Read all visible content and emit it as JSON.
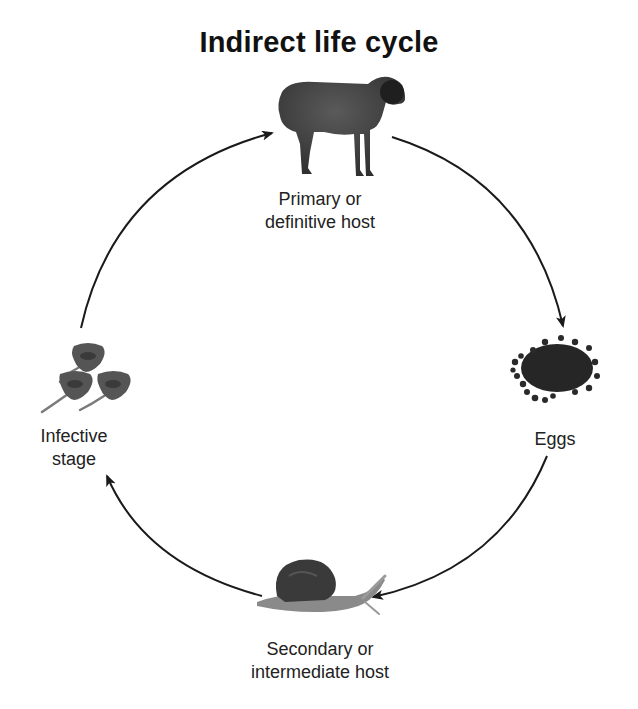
{
  "diagram": {
    "title": "Indirect life cycle",
    "type": "cycle",
    "direction": "clockwise",
    "colors": {
      "background": "#ffffff",
      "text": "#222222",
      "arrow": "#1a1a1a",
      "image_fill": "#3a3a3a"
    },
    "nodes": [
      {
        "id": "primary-host",
        "icon": "sheep-icon",
        "label_lines": [
          "Primary or",
          "definitive host"
        ],
        "position": "top"
      },
      {
        "id": "eggs",
        "icon": "eggs-cluster-icon",
        "label_lines": [
          "Eggs"
        ],
        "position": "right"
      },
      {
        "id": "secondary-host",
        "icon": "snail-icon",
        "label_lines": [
          "Secondary or",
          "intermediate host"
        ],
        "position": "bottom"
      },
      {
        "id": "infective-stage",
        "icon": "cercariae-icon",
        "label_lines": [
          "Infective",
          "stage"
        ],
        "position": "left"
      }
    ],
    "edges": [
      {
        "from": "primary-host",
        "to": "eggs"
      },
      {
        "from": "eggs",
        "to": "secondary-host"
      },
      {
        "from": "secondary-host",
        "to": "infective-stage"
      },
      {
        "from": "infective-stage",
        "to": "primary-host"
      }
    ]
  }
}
